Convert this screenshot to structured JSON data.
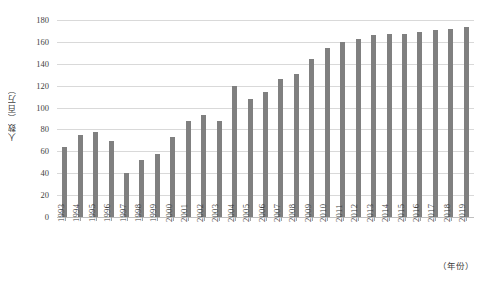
{
  "chart_data": {
    "type": "bar",
    "title": "",
    "xlabel": "（年份）",
    "ylabel": "人数（百万）",
    "ylim": [
      0,
      180
    ],
    "yticks": [
      0,
      20,
      40,
      60,
      80,
      100,
      120,
      140,
      160,
      180
    ],
    "grid": true,
    "legend": "none",
    "bar_color": "#808080",
    "gridline_color": "#d9d9d9",
    "categories": [
      "1993",
      "1994",
      "1995",
      "1996",
      "1997",
      "1998",
      "1999",
      "2000",
      "2001",
      "2002",
      "2003",
      "2004",
      "2005",
      "2006",
      "2007",
      "2008",
      "2009",
      "2010",
      "2011",
      "2012",
      "2013",
      "2014",
      "2015",
      "2016",
      "2017",
      "2018",
      "2019"
    ],
    "values": [
      64,
      75,
      78,
      69,
      40,
      52,
      58,
      73,
      88,
      93,
      88,
      120,
      108,
      114,
      126,
      131,
      144,
      154,
      160,
      163,
      166,
      167,
      167,
      169,
      171,
      172,
      174
    ]
  }
}
